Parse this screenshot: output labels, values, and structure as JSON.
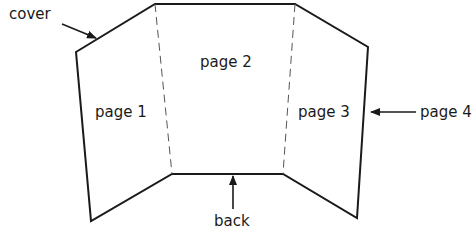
{
  "diagram": {
    "panels": {
      "page1": "page 1",
      "page2": "page 2",
      "page3": "page 3"
    },
    "callouts": {
      "cover": "cover",
      "page4": "page 4",
      "back": "back"
    },
    "colors": {
      "line": "#1a1a1a",
      "fold": "#555555",
      "background": "#ffffff"
    }
  }
}
